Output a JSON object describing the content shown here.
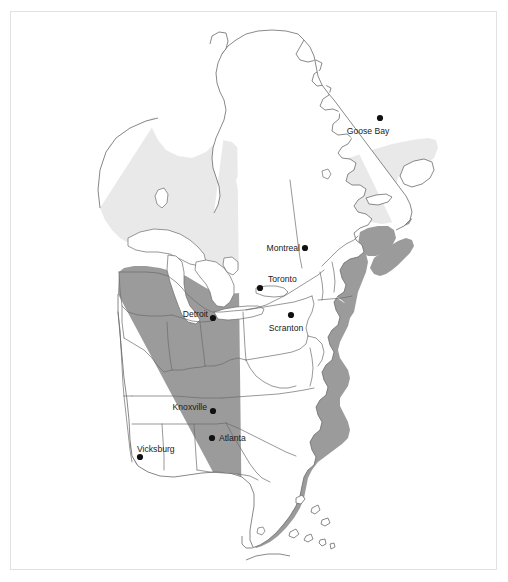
{
  "figure": {
    "name": "eastern-north-america-range-map",
    "background_color": "#ffffff",
    "frame_color": "#e2e2e2"
  },
  "legend_colors": {
    "zone_light": "#e9e9e9",
    "zone_dark": "#9b9b9b",
    "water": "#ffffff",
    "outline": "#6b6b6b",
    "dot": "#111111",
    "label_text": "#1a1a1a"
  },
  "zones": [
    {
      "id": "zone-light",
      "name": "light-shaded-range-zone",
      "color": "#e9e9e9",
      "description": "boreal northern shading across central and eastern Canada"
    },
    {
      "id": "zone-dark",
      "name": "dark-shaded-range-zone",
      "color": "#9b9b9b",
      "description": "darker shading across the eastern United States and maritime Canada"
    }
  ],
  "cities": [
    {
      "name": "Goose Bay",
      "label": "Goose Bay",
      "dot_x": 380,
      "dot_y": 118,
      "label_x": 368,
      "label_y": 134,
      "anchor": "middle"
    },
    {
      "name": "Montreal",
      "label": "Montreal",
      "dot_x": 305,
      "dot_y": 248,
      "label_x": 300,
      "label_y": 251,
      "anchor": "end"
    },
    {
      "name": "Toronto",
      "label": "Toronto",
      "dot_x": 260,
      "dot_y": 288,
      "label_x": 268,
      "label_y": 282,
      "anchor": "start"
    },
    {
      "name": "Detroit",
      "label": "Detroit",
      "dot_x": 213,
      "dot_y": 318,
      "label_x": 208,
      "label_y": 317,
      "anchor": "end"
    },
    {
      "name": "Scranton",
      "label": "Scranton",
      "dot_x": 291,
      "dot_y": 315,
      "label_x": 286,
      "label_y": 331,
      "anchor": "middle"
    },
    {
      "name": "Knoxville",
      "label": "Knoxville",
      "dot_x": 213,
      "dot_y": 411,
      "label_x": 207,
      "label_y": 410,
      "anchor": "end"
    },
    {
      "name": "Atlanta",
      "label": "Atlanta",
      "dot_x": 212,
      "dot_y": 438,
      "label_x": 219,
      "label_y": 441,
      "anchor": "start"
    },
    {
      "name": "Vicksburg",
      "label": "Vicksburg",
      "dot_x": 140,
      "dot_y": 457,
      "label_x": 137,
      "label_y": 452,
      "anchor": "start"
    }
  ],
  "water_bodies": [
    {
      "name": "lake-superior"
    },
    {
      "name": "lake-michigan"
    },
    {
      "name": "lake-huron"
    },
    {
      "name": "lake-erie"
    },
    {
      "name": "lake-ontario"
    },
    {
      "name": "lake-winnipeg"
    },
    {
      "name": "lake-okeechobee"
    },
    {
      "name": "hudson-bay"
    }
  ]
}
